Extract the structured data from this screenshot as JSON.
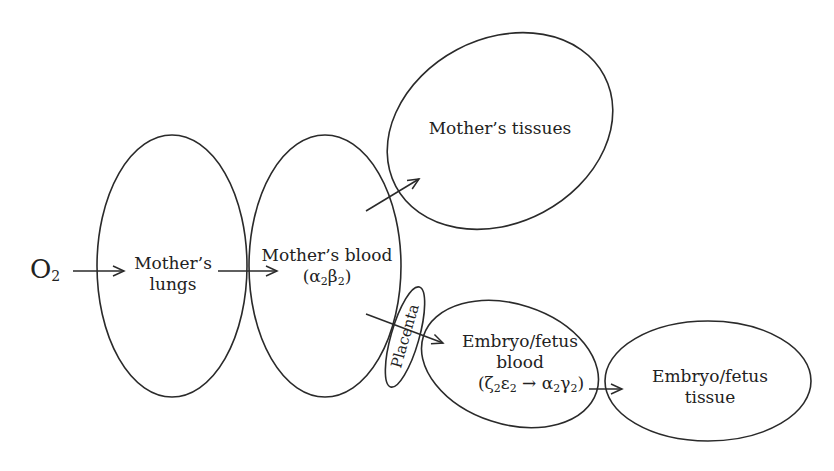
{
  "diagram": {
    "type": "oxygen-flow",
    "nodes": {
      "oxygen": {
        "symbol": "O",
        "subscript": "2"
      },
      "lungs": {
        "line1": "Mother’s",
        "line2": "lungs"
      },
      "mother_blood": {
        "line1": "Mother’s blood",
        "formula": {
          "open": "(α",
          "s1": "2",
          "mid": "β",
          "s2": "2",
          "close": ")"
        }
      },
      "mother_tissues": {
        "label": "Mother’s tissues"
      },
      "placenta": {
        "label": "Placenta"
      },
      "embryo_blood": {
        "line1": "Embryo/fetus",
        "line2": "blood",
        "formula": {
          "open": "(ζ",
          "s1": "2",
          "a": "ε",
          "s2": "2",
          "arrow": " → α",
          "s3": "2",
          "b": "γ",
          "s4": "2",
          "close": ")"
        }
      },
      "embryo_tissue": {
        "line1": "Embryo/fetus",
        "line2": "tissue"
      }
    },
    "edges": [
      {
        "from": "oxygen",
        "to": "lungs"
      },
      {
        "from": "lungs",
        "to": "mother_blood"
      },
      {
        "from": "mother_blood",
        "to": "mother_tissues"
      },
      {
        "from": "mother_blood",
        "to": "embryo_blood",
        "via": "placenta"
      },
      {
        "from": "embryo_blood",
        "to": "embryo_tissue"
      }
    ],
    "colors": {
      "stroke": "#2a2a2a",
      "text": "#222222",
      "background": "#ffffff"
    }
  }
}
